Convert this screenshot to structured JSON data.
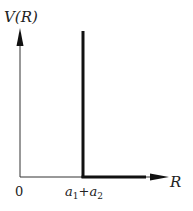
{
  "diagram": {
    "y_axis_label": "V(R)",
    "x_axis_label": "R",
    "origin_label": "0",
    "wall_label_a1": "a",
    "wall_label_sub1": "1",
    "wall_label_plus": "+",
    "wall_label_a2": "a",
    "wall_label_sub2": "2",
    "colors": {
      "line": "#111111",
      "axis": "#333333"
    }
  }
}
